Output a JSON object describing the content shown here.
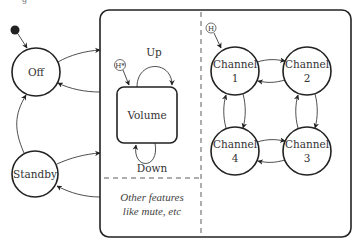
{
  "figure": {
    "caption_fragment": "g",
    "colors": {
      "stroke": "#222222",
      "text": "#333333",
      "background": "#ffffff"
    }
  },
  "states": {
    "initial": {
      "icon": "initial-state-dot"
    },
    "off": {
      "label": "Off"
    },
    "standby": {
      "label": "Standby"
    }
  },
  "composite": {
    "volume_region": {
      "history_marker": "H*",
      "volume": {
        "label": "Volume"
      },
      "up_label": "Up",
      "down_label": "Down",
      "other_features_line1": "Other features",
      "other_features_line2": "like mute, etc"
    },
    "channel_region": {
      "history_marker": "H",
      "channels": [
        {
          "line1": "Channel",
          "line2": "1"
        },
        {
          "line1": "Channel",
          "line2": "2"
        },
        {
          "line1": "Channel",
          "line2": "3"
        },
        {
          "line1": "Channel",
          "line2": "4"
        }
      ]
    }
  }
}
